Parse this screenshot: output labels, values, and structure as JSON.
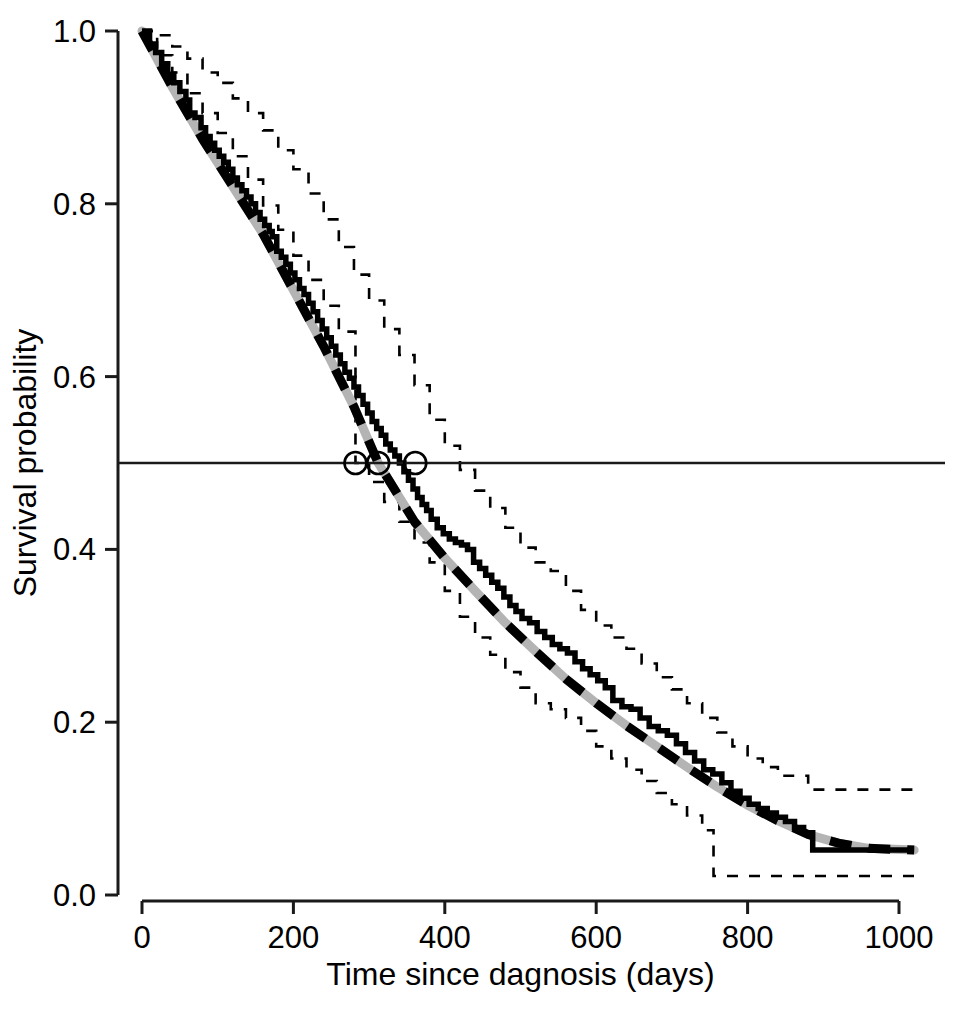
{
  "chart_data": {
    "type": "line",
    "title": "",
    "subtitle": "",
    "xlabel": "Time since dagnosis (days)",
    "ylabel": "Survival probability",
    "xlim": [
      0,
      1020
    ],
    "ylim": [
      0.0,
      1.0
    ],
    "grid": false,
    "legend": "none",
    "xticks": [
      0,
      200,
      400,
      600,
      800,
      1000
    ],
    "xticklabels": [
      "0",
      "200",
      "400",
      "600",
      "800",
      "1000"
    ],
    "yticks": [
      0.0,
      0.2,
      0.4,
      0.6,
      0.8,
      1.0
    ],
    "yticklabels": [
      "0.0",
      "0.2",
      "0.4",
      "0.6",
      "0.8",
      "1.0"
    ],
    "annotations": {
      "median_reference_line": {
        "y": 0.5,
        "style": "solid thin horizontal line spanning plot width"
      },
      "median_markers": {
        "style": "open circles on the y = 0.5 reference line",
        "points": [
          {
            "label": "lower confidence limit of median",
            "x": 282,
            "y": 0.5
          },
          {
            "label": "median survival estimate",
            "x": 312,
            "y": 0.5
          },
          {
            "label": "upper confidence limit of median",
            "x": 361,
            "y": 0.5
          }
        ]
      }
    },
    "series": [
      {
        "name": "Kaplan-Meier estimate",
        "style": "solid black step",
        "step": "post",
        "x": [
          0,
          10,
          18,
          26,
          34,
          42,
          50,
          58,
          63,
          70,
          78,
          84,
          90,
          96,
          102,
          108,
          114,
          120,
          126,
          132,
          138,
          144,
          150,
          156,
          162,
          168,
          172,
          178,
          184,
          190,
          196,
          202,
          208,
          214,
          220,
          226,
          232,
          238,
          244,
          250,
          256,
          262,
          268,
          274,
          280,
          286,
          292,
          298,
          304,
          310,
          316,
          322,
          328,
          334,
          340,
          346,
          352,
          358,
          364,
          370,
          376,
          382,
          390,
          398,
          406,
          414,
          422,
          430,
          438,
          446,
          454,
          462,
          470,
          478,
          486,
          494,
          502,
          512,
          522,
          532,
          542,
          552,
          562,
          572,
          582,
          592,
          602,
          612,
          622,
          634,
          646,
          658,
          670,
          682,
          694,
          706,
          718,
          730,
          742,
          754,
          766,
          778,
          790,
          802,
          814,
          826,
          838,
          850,
          862,
          874,
          886,
          1020
        ],
        "y": [
          1.0,
          0.985,
          0.975,
          0.962,
          0.95,
          0.94,
          0.93,
          0.92,
          0.905,
          0.9,
          0.888,
          0.878,
          0.87,
          0.862,
          0.855,
          0.848,
          0.84,
          0.83,
          0.822,
          0.815,
          0.808,
          0.8,
          0.79,
          0.782,
          0.775,
          0.768,
          0.762,
          0.745,
          0.738,
          0.73,
          0.72,
          0.712,
          0.702,
          0.695,
          0.685,
          0.675,
          0.665,
          0.655,
          0.645,
          0.635,
          0.625,
          0.615,
          0.605,
          0.598,
          0.588,
          0.578,
          0.568,
          0.558,
          0.548,
          0.54,
          0.532,
          0.522,
          0.515,
          0.508,
          0.5,
          0.49,
          0.48,
          0.47,
          0.46,
          0.452,
          0.445,
          0.435,
          0.425,
          0.418,
          0.412,
          0.408,
          0.405,
          0.4,
          0.385,
          0.378,
          0.37,
          0.362,
          0.355,
          0.345,
          0.335,
          0.328,
          0.32,
          0.315,
          0.305,
          0.298,
          0.29,
          0.285,
          0.28,
          0.27,
          0.262,
          0.255,
          0.248,
          0.24,
          0.225,
          0.218,
          0.215,
          0.205,
          0.195,
          0.19,
          0.185,
          0.175,
          0.165,
          0.155,
          0.145,
          0.14,
          0.13,
          0.12,
          0.112,
          0.105,
          0.1,
          0.095,
          0.09,
          0.085,
          0.078,
          0.072,
          0.052,
          0.052
        ]
      },
      {
        "name": "Fitted parametric model",
        "style": "thick black dashed line over grey line",
        "x": [
          0,
          40,
          80,
          120,
          160,
          200,
          240,
          280,
          312,
          360,
          400,
          440,
          480,
          520,
          560,
          600,
          640,
          680,
          720,
          760,
          800,
          840,
          880,
          920,
          960,
          1020
        ],
        "y": [
          1.0,
          0.935,
          0.875,
          0.82,
          0.765,
          0.7,
          0.635,
          0.565,
          0.5,
          0.432,
          0.39,
          0.352,
          0.315,
          0.282,
          0.25,
          0.222,
          0.196,
          0.172,
          0.148,
          0.125,
          0.104,
          0.086,
          0.07,
          0.06,
          0.054,
          0.052
        ]
      },
      {
        "name": "Upper 95% confidence limit",
        "style": "thin black dashed step",
        "step": "post",
        "x": [
          0,
          20,
          40,
          60,
          80,
          100,
          120,
          140,
          160,
          180,
          200,
          220,
          240,
          260,
          280,
          300,
          320,
          340,
          360,
          380,
          400,
          420,
          440,
          460,
          480,
          500,
          520,
          540,
          560,
          580,
          600,
          620,
          640,
          660,
          680,
          700,
          720,
          740,
          760,
          780,
          800,
          820,
          840,
          880,
          1020
        ],
        "y": [
          1.0,
          0.995,
          0.982,
          0.968,
          0.952,
          0.94,
          0.922,
          0.905,
          0.885,
          0.862,
          0.84,
          0.812,
          0.782,
          0.75,
          0.718,
          0.688,
          0.655,
          0.625,
          0.59,
          0.55,
          0.52,
          0.492,
          0.468,
          0.448,
          0.425,
          0.402,
          0.385,
          0.375,
          0.352,
          0.33,
          0.312,
          0.298,
          0.285,
          0.268,
          0.252,
          0.238,
          0.222,
          0.205,
          0.188,
          0.172,
          0.158,
          0.148,
          0.138,
          0.122,
          0.122
        ]
      },
      {
        "name": "Lower 95% confidence limit",
        "style": "thin black dashed step",
        "step": "post",
        "x": [
          0,
          20,
          40,
          60,
          80,
          100,
          120,
          140,
          160,
          180,
          200,
          220,
          240,
          260,
          282,
          300,
          320,
          340,
          360,
          380,
          400,
          420,
          440,
          460,
          480,
          500,
          520,
          540,
          560,
          580,
          600,
          620,
          640,
          660,
          680,
          700,
          720,
          740,
          755,
          780,
          800,
          840,
          880,
          1020
        ],
        "y": [
          1.0,
          0.972,
          0.952,
          0.928,
          0.905,
          0.882,
          0.855,
          0.828,
          0.798,
          0.77,
          0.74,
          0.712,
          0.682,
          0.652,
          0.5,
          0.478,
          0.455,
          0.432,
          0.408,
          0.385,
          0.352,
          0.322,
          0.298,
          0.278,
          0.258,
          0.24,
          0.222,
          0.215,
          0.205,
          0.19,
          0.172,
          0.158,
          0.145,
          0.132,
          0.118,
          0.105,
          0.092,
          0.075,
          0.022,
          0.022,
          0.022,
          0.022,
          0.022,
          0.022
        ]
      }
    ]
  }
}
